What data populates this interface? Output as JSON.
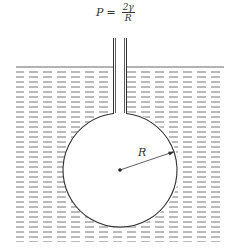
{
  "diagram": {
    "formula": {
      "lhs": "P",
      "equals": "=",
      "numerator": "2γ",
      "denominator": "R"
    },
    "radius_label": "R",
    "colors": {
      "line": "#333333",
      "liquid_dash": "#555555",
      "background": "#ffffff"
    }
  }
}
